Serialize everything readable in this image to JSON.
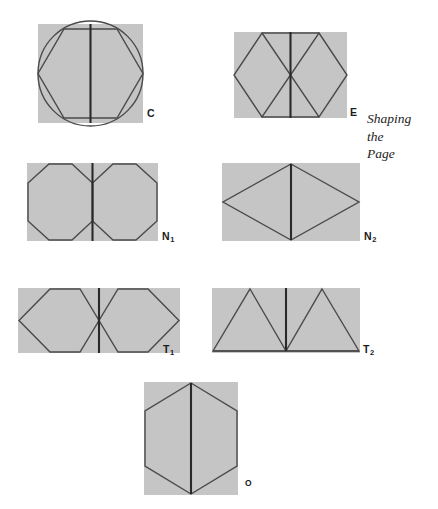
{
  "page": {
    "width": 438,
    "height": 509,
    "background_color": "#ffffff",
    "running_head": {
      "line1": "Shaping",
      "line2": "the",
      "line3": "Page"
    }
  },
  "style": {
    "panel_fill": "#c5c5c5",
    "stroke_color": "#4a4a4a",
    "centerline_color": "#2a2a2a",
    "stroke_width": 1.4,
    "centerline_width": 2.1,
    "label_color": "#1b1b1b"
  },
  "figures": [
    {
      "id": "C",
      "label": "C",
      "label_sub": "",
      "caption_note": "square panel with inscribed circle and inscribed hexagon, vertical centreline",
      "panel": {
        "x": 38,
        "y": 24,
        "w": 105,
        "h": 99
      },
      "label_pos": {
        "x": 147,
        "y": 108
      },
      "shapes": [
        "gray-square",
        "circle",
        "hexagon-inscribed",
        "vertical-centerline"
      ]
    },
    {
      "id": "E",
      "label": "E",
      "label_sub": "",
      "caption_note": "square panel with two adjoining rhombi, vertical centreline",
      "panel": {
        "x": 234,
        "y": 32,
        "w": 113,
        "h": 86
      },
      "label_pos": {
        "x": 350,
        "y": 107
      },
      "shapes": [
        "gray-square",
        "rhombus-left",
        "rhombus-right",
        "vertical-centerline"
      ]
    },
    {
      "id": "N1",
      "label": "N",
      "label_sub": "1",
      "caption_note": "wide panel with two hexagons sharing a vertical edge",
      "panel": {
        "x": 27,
        "y": 163,
        "w": 131,
        "h": 78
      },
      "label_pos": {
        "x": 162,
        "y": 231
      },
      "shapes": [
        "gray-rectangle",
        "hexagon-left",
        "hexagon-right",
        "vertical-centerline"
      ]
    },
    {
      "id": "N2",
      "label": "N",
      "label_sub": "2",
      "caption_note": "wide panel with one large rhombus, vertical centreline",
      "panel": {
        "x": 222,
        "y": 163,
        "w": 138,
        "h": 78
      },
      "label_pos": {
        "x": 364,
        "y": 231
      },
      "shapes": [
        "gray-rectangle",
        "rhombus-large",
        "vertical-centerline"
      ]
    },
    {
      "id": "T1",
      "label": "T",
      "label_sub": "1",
      "caption_note": "wide panel with two hexagons meeting at a central point",
      "panel": {
        "x": 18,
        "y": 288,
        "w": 162,
        "h": 65
      },
      "label_pos": {
        "x": 163,
        "y": 344
      },
      "shapes": [
        "gray-rectangle",
        "hexagon-left-pointed",
        "hexagon-right-pointed",
        "vertical-centerline"
      ]
    },
    {
      "id": "T2",
      "label": "T",
      "label_sub": "2",
      "caption_note": "wide panel with two triangles meeting at bottom centre",
      "panel": {
        "x": 212,
        "y": 288,
        "w": 148,
        "h": 65
      },
      "label_pos": {
        "x": 363,
        "y": 344
      },
      "shapes": [
        "gray-rectangle",
        "triangle-left",
        "triangle-right",
        "baseline",
        "vertical-centerline"
      ]
    },
    {
      "id": "O",
      "label": "O",
      "label_sub": "",
      "caption_note": "tall panel with a single vertical hexagon, vertical centreline",
      "panel": {
        "x": 144,
        "y": 382,
        "w": 94,
        "h": 113
      },
      "label_pos": {
        "x": 245,
        "y": 479
      },
      "shapes": [
        "gray-rectangle",
        "hexagon-vertical",
        "vertical-centerline"
      ]
    }
  ]
}
